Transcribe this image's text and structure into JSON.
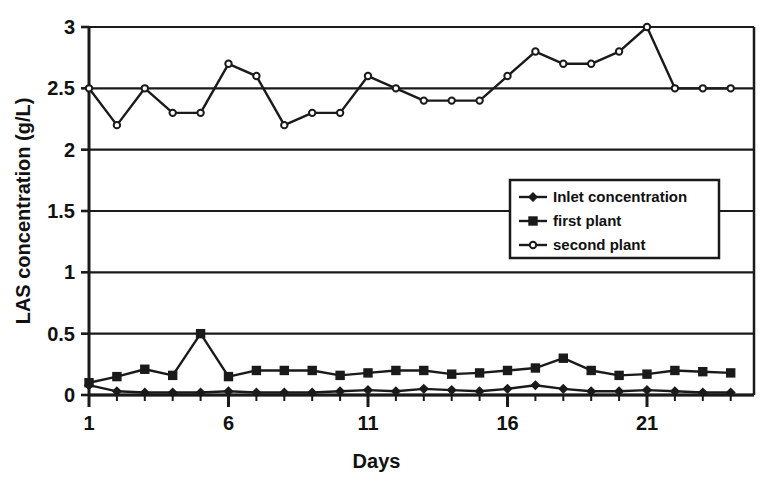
{
  "chart_data": {
    "type": "line",
    "title": "",
    "xlabel": "Days",
    "ylabel": "LAS concentration (g/L)",
    "xlim": [
      1,
      24
    ],
    "ylim": [
      0,
      3
    ],
    "xticks": [
      1,
      6,
      11,
      16,
      21
    ],
    "xtick_labels": [
      "1",
      "6",
      "11",
      "16",
      "21"
    ],
    "yticks": [
      0,
      0.5,
      1,
      1.5,
      2,
      2.5,
      3
    ],
    "ytick_labels": [
      "0",
      "0.5",
      "1",
      "1.5",
      "2",
      "2.5",
      "3"
    ],
    "grid": "horizontal",
    "legend_position": "center-right",
    "x": [
      1,
      2,
      3,
      4,
      5,
      6,
      7,
      8,
      9,
      10,
      11,
      12,
      13,
      14,
      15,
      16,
      17,
      18,
      19,
      20,
      21,
      22,
      23,
      24
    ],
    "series": [
      {
        "name": "Inlet concentration",
        "marker": "diamond",
        "values": [
          0.08,
          0.03,
          0.02,
          0.02,
          0.02,
          0.03,
          0.02,
          0.02,
          0.02,
          0.03,
          0.04,
          0.03,
          0.05,
          0.04,
          0.03,
          0.05,
          0.08,
          0.05,
          0.03,
          0.03,
          0.04,
          0.03,
          0.02,
          0.02
        ]
      },
      {
        "name": "first plant",
        "marker": "square-filled",
        "values": [
          0.1,
          0.15,
          0.21,
          0.16,
          0.5,
          0.15,
          0.2,
          0.2,
          0.2,
          0.16,
          0.18,
          0.2,
          0.2,
          0.17,
          0.18,
          0.2,
          0.22,
          0.3,
          0.2,
          0.16,
          0.17,
          0.2,
          0.19,
          0.18
        ]
      },
      {
        "name": "second plant",
        "marker": "circle-open",
        "values": [
          2.5,
          2.2,
          2.5,
          2.3,
          2.3,
          2.7,
          2.6,
          2.2,
          2.3,
          2.3,
          2.6,
          2.5,
          2.4,
          2.4,
          2.4,
          2.6,
          2.8,
          2.7,
          2.7,
          2.8,
          3.0,
          2.5,
          2.5,
          2.5
        ]
      }
    ],
    "colors": {
      "line": "#1a1a1a",
      "axis": "#1a1a1a",
      "grid": "#1a1a1a",
      "background": "#ffffff"
    }
  },
  "legend": {
    "entries": [
      {
        "label": "Inlet concentration",
        "marker": "diamond"
      },
      {
        "label": "first plant",
        "marker": "square-filled"
      },
      {
        "label": "second plant",
        "marker": "circle-open"
      }
    ]
  }
}
